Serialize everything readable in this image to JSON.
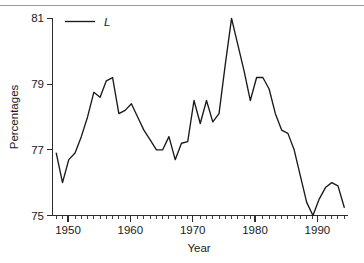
{
  "figure": {
    "background_color": "#ffffff",
    "line_color": "#1a1a1a",
    "rule_color": "#9a9a9a"
  },
  "axes": {
    "y_title": "Percentages",
    "x_title": "Year",
    "y_ticks": [
      "75",
      "77",
      "79",
      "81"
    ],
    "x_ticks": [
      "1950",
      "1960",
      "1970",
      "1980",
      "1990"
    ]
  },
  "legend": {
    "entries": [
      {
        "label": "L",
        "marker": "line-segment"
      }
    ]
  },
  "chart_data": {
    "type": "line",
    "title": "",
    "subtitle": "",
    "xlabel": "Year",
    "ylabel": "Percentages",
    "xlim": [
      1947.4,
      1994.6
    ],
    "ylim": [
      75,
      81
    ],
    "y_ticks": [
      75,
      77,
      79,
      81
    ],
    "x_ticks": [
      1950,
      1960,
      1970,
      1980,
      1990
    ],
    "x_minor_tick_interval": 1,
    "grid": false,
    "legend_position": "top-left",
    "series": [
      {
        "name": "L",
        "color": "#1a1a1a",
        "x": [
          1948,
          1949,
          1950,
          1951,
          1952,
          1953,
          1954,
          1955,
          1956,
          1957,
          1958,
          1959,
          1960,
          1961,
          1962,
          1963,
          1964,
          1965,
          1966,
          1967,
          1968,
          1969,
          1970,
          1971,
          1972,
          1973,
          1974,
          1975,
          1976,
          1977,
          1978,
          1979,
          1980,
          1981,
          1982,
          1983,
          1984,
          1985,
          1986,
          1987,
          1988,
          1989,
          1990,
          1991,
          1992,
          1993,
          1994
        ],
        "values": [
          76.9,
          76.0,
          76.7,
          76.9,
          77.4,
          78.0,
          78.75,
          78.6,
          79.1,
          79.2,
          78.1,
          78.2,
          78.4,
          78.0,
          77.6,
          77.3,
          77.0,
          77.0,
          77.4,
          76.7,
          77.2,
          77.25,
          78.5,
          77.8,
          78.5,
          77.85,
          78.1,
          79.6,
          81.0,
          80.2,
          79.4,
          78.5,
          79.2,
          79.2,
          78.85,
          78.1,
          77.6,
          77.5,
          77.0,
          76.2,
          75.4,
          75.0,
          75.5,
          75.85,
          76.0,
          75.9,
          75.25
        ]
      }
    ]
  }
}
